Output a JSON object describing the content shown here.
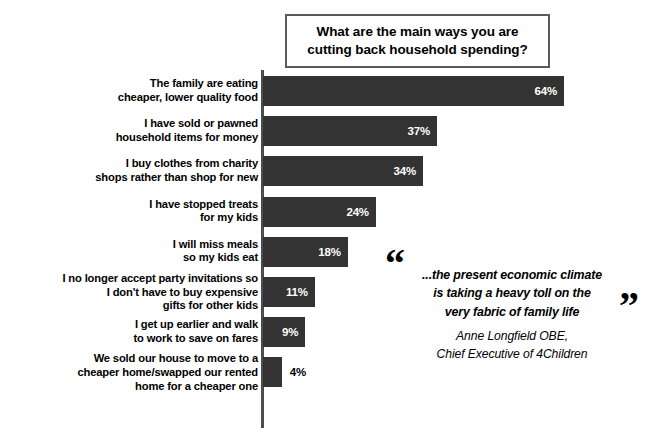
{
  "title": {
    "text": "What are the main ways you are cutting back household spending?"
  },
  "chart_data": {
    "type": "bar",
    "orientation": "horizontal",
    "title": "What are the main ways you are cutting back household spending?",
    "xlabel": "",
    "ylabel": "",
    "xlim": [
      0,
      64
    ],
    "grid": false,
    "legend": null,
    "value_suffix": "%",
    "bar_color": "#333333",
    "categories": [
      "The family are eating\ncheaper, lower quality food",
      "I have sold or pawned\nhousehold items for money",
      "I buy clothes from charity\nshops rather than shop for new",
      "I have stopped treats\nfor my kids",
      "I will miss meals\nso my kids eat",
      "I no longer accept party invitations so\nI don't have to buy expensive\ngifts for other kids",
      "I get up earlier and walk\nto work to save on fares",
      "We sold our house to move to a\ncheaper home/swapped our rented\nhome for a cheaper one"
    ],
    "values": [
      64,
      37,
      34,
      24,
      18,
      11,
      9,
      4
    ],
    "value_labels": [
      "64%",
      "37%",
      "34%",
      "24%",
      "18%",
      "11%",
      "9%",
      "4%"
    ],
    "label_position": [
      "inside",
      "inside",
      "inside",
      "inside",
      "inside",
      "inside",
      "inside",
      "outside"
    ]
  },
  "quote": {
    "open_mark": "“",
    "close_mark": "”",
    "text": "...the present economic climate\nis taking a heavy toll on the\nvery fabric of family life",
    "attribution": "Anne Longfield OBE,\nChief Executive of 4Children"
  }
}
